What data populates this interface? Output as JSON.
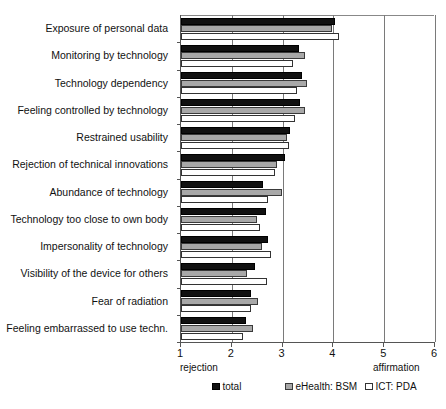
{
  "chart_data": {
    "type": "bar",
    "orientation": "horizontal",
    "title": "",
    "xlabel": "",
    "ylabel": "",
    "xlim": [
      1,
      6
    ],
    "xticks": [
      1,
      2,
      3,
      4,
      5,
      6
    ],
    "xticklabels": [
      "1",
      "2",
      "3",
      "4",
      "5",
      "6"
    ],
    "grid": true,
    "axis_endpoint_labels": {
      "left": "rejection",
      "right": "affirmation"
    },
    "legend_position": "bottom",
    "categories": [
      "Exposure of personal data",
      "Monitoring by technology",
      "Technology dependency",
      "Feeling controlled by technology",
      "Restrained usability",
      "Rejection of technical innovations",
      "Abundance of technology",
      "Technology too close to own body",
      "Impersonality of technology",
      "Visibility of the device for others",
      "Fear of radiation",
      "Feeling embarrassed to use techn."
    ],
    "series": [
      {
        "name": "total",
        "color": "#111111",
        "values": [
          4.03,
          3.32,
          3.38,
          3.35,
          3.15,
          3.05,
          2.62,
          2.68,
          2.72,
          2.45,
          2.38,
          2.28
        ]
      },
      {
        "name": "eHealth: BSM",
        "color": "#a8a8a8",
        "values": [
          3.97,
          3.45,
          3.48,
          3.45,
          3.08,
          2.88,
          2.98,
          2.5,
          2.6,
          2.3,
          2.52,
          2.42
        ]
      },
      {
        "name": "ICT: PDA",
        "color": "#ffffff",
        "values": [
          4.11,
          3.2,
          3.28,
          3.25,
          3.12,
          2.85,
          2.72,
          2.55,
          2.78,
          2.7,
          2.38,
          2.22
        ]
      }
    ]
  },
  "legend": {
    "items": [
      {
        "label": "total",
        "key": "total"
      },
      {
        "label": "eHealth: BSM",
        "key": "bsm"
      },
      {
        "label": "ICT: PDA",
        "key": "pda"
      }
    ]
  }
}
